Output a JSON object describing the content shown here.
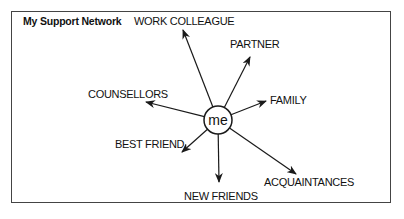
{
  "title": "My Support Network",
  "center": {
    "label": "me"
  },
  "nodes": [
    {
      "id": "work-colleague",
      "label": "WORK COLLEAGUE"
    },
    {
      "id": "partner",
      "label": "PARTNER"
    },
    {
      "id": "family",
      "label": "FAMILY"
    },
    {
      "id": "counsellors",
      "label": "COUNSELLORS"
    },
    {
      "id": "best-friend",
      "label": "BEST FRIEND"
    },
    {
      "id": "new-friends",
      "label": "NEW FRIENDS"
    },
    {
      "id": "acquaintances",
      "label": "ACQUAINTANCES"
    }
  ],
  "edges": [
    {
      "from": "me",
      "to": "work-colleague"
    },
    {
      "from": "me",
      "to": "partner"
    },
    {
      "from": "me",
      "to": "family"
    },
    {
      "from": "me",
      "to": "counsellors"
    },
    {
      "from": "me",
      "to": "best-friend"
    },
    {
      "from": "me",
      "to": "new-friends"
    },
    {
      "from": "me",
      "to": "acquaintances"
    }
  ],
  "colors": {
    "stroke": "#1a1a1a",
    "frame": "#444444",
    "background": "#ffffff"
  }
}
